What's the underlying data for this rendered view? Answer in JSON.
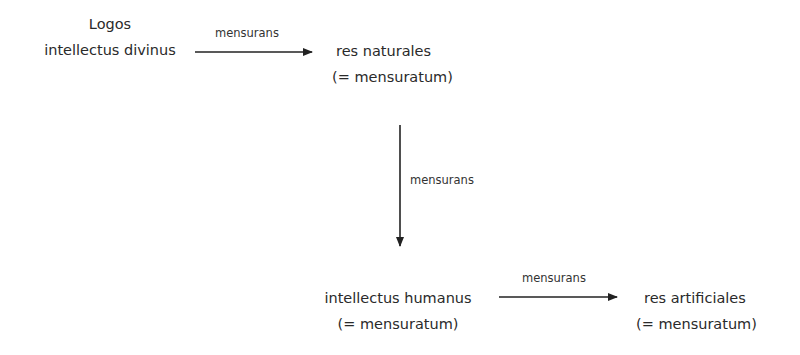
{
  "diagram": {
    "nodes": [
      {
        "id": "logos",
        "line1": "Logos",
        "line2": "intellectus divinus"
      },
      {
        "id": "res-naturales",
        "line1": "res naturales",
        "line2": "(= mensuratum)"
      },
      {
        "id": "intellectus-humanus",
        "line1": "intellectus humanus",
        "line2": "(= mensuratum)"
      },
      {
        "id": "res-artificiales",
        "line1": "res artificiales",
        "line2": "(= mensuratum)"
      }
    ],
    "edges": [
      {
        "from": "logos",
        "to": "res-naturales",
        "label": "mensurans"
      },
      {
        "from": "res-naturales",
        "to": "intellectus-humanus",
        "label": "mensurans"
      },
      {
        "from": "intellectus-humanus",
        "to": "res-artificiales",
        "label": "mensurans"
      }
    ],
    "colors": {
      "text": "#2a2a2a",
      "arrow": "#222222"
    }
  }
}
